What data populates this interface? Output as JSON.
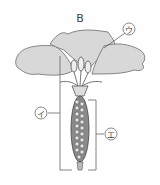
{
  "figure": {
    "title": "B",
    "labels": {
      "u": "ウ",
      "i": "イ",
      "e": "エ"
    },
    "colors": {
      "petal_fill": "#d8d8d8",
      "petal_stroke": "#6b6b6b",
      "ovary_fill": "#8a8a8a",
      "ovule_fill": "#e6e6e6",
      "line": "#555555"
    }
  }
}
